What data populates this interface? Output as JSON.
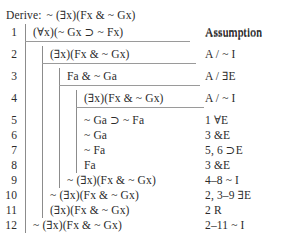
{
  "header": {
    "derive_label": "Derive:",
    "goal_formula": "~ (∃x)(Fx & ~ Gx)",
    "justification_column_heading": "Assumption"
  },
  "proof": {
    "lines": [
      {
        "number": "1",
        "formula": "(∀x)(~ Gx ⊃ ~ Fx)",
        "justification": "Assumption",
        "depth": 1
      },
      {
        "number": "2",
        "formula": "(∃x)(Fx & ~ Gx)",
        "justification": "A / ~ I",
        "depth": 2
      },
      {
        "number": "3",
        "formula": "Fa & ~ Ga",
        "justification": "A / ∃E",
        "depth": 3
      },
      {
        "number": "4",
        "formula": "(∃x)(Fx & ~ Gx)",
        "justification": "A / ~ I",
        "depth": 4
      },
      {
        "number": "5",
        "formula": "~ Ga ⊃ ~ Fa",
        "justification": "1 ∀E",
        "depth": 4
      },
      {
        "number": "6",
        "formula": "~ Ga",
        "justification": "3 &E",
        "depth": 4
      },
      {
        "number": "7",
        "formula": "~ Fa",
        "justification": "5, 6 ⊃E",
        "depth": 4
      },
      {
        "number": "8",
        "formula": "Fa",
        "justification": "3 &E",
        "depth": 4
      },
      {
        "number": "9",
        "formula": "~ (∃x)(Fx & ~ Gx)",
        "justification": "4–8 ~ I",
        "depth": 3
      },
      {
        "number": "10",
        "formula": "~ (∃x)(Fx & ~ Gx)",
        "justification": "2, 3–9 ∃E",
        "depth": 2
      },
      {
        "number": "11",
        "formula": "(∃x)(Fx & ~ Gx)",
        "justification": "2 R",
        "depth": 2
      },
      {
        "number": "12",
        "formula": "~ (∃x)(Fx & ~ Gx)",
        "justification": "2–11 ~ I",
        "depth": 1
      }
    ]
  },
  "style": {
    "text_color": "#2b2b2b",
    "rule_color": "#9a9a9a",
    "bar_color": "#8c8c8c",
    "background": "#ffffff"
  }
}
